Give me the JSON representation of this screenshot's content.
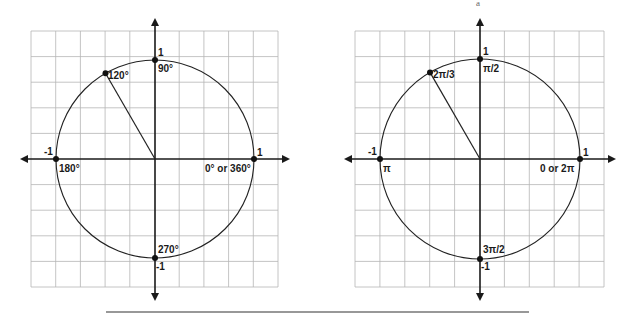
{
  "diagrams": [
    {
      "name": "unit-circle-degrees",
      "center": [
        155,
        159
      ],
      "radius": 99,
      "grid": {
        "x0": 31,
        "y0": 31,
        "x1": 278,
        "y1": 287,
        "cols": 10,
        "rows": 10
      },
      "labels": {
        "top_value": "1",
        "top_angle": "90°",
        "left_value": "-1",
        "left_angle": "180°",
        "right_value": "1",
        "right_angle": "0° or 360°",
        "bottom_value": "-1",
        "bottom_angle": "270°",
        "highlight_angle": "120°"
      }
    },
    {
      "name": "unit-circle-radians",
      "center": [
        480,
        159
      ],
      "radius": 100,
      "grid": {
        "x0": 355,
        "y0": 31,
        "x1": 604,
        "y1": 287,
        "cols": 10,
        "rows": 10
      },
      "labels": {
        "top_value": "1",
        "top_angle": "π/2",
        "left_value": "-1",
        "left_angle": "π",
        "right_value": "1",
        "right_angle": "0 or 2π",
        "bottom_value": "-1",
        "bottom_angle": "3π/2",
        "highlight_angle": "2π/3"
      }
    }
  ],
  "top_mark": "a",
  "colors": {
    "grid": "#b5b5b5",
    "axis": "#1a1a1a",
    "circle": "#222222"
  }
}
